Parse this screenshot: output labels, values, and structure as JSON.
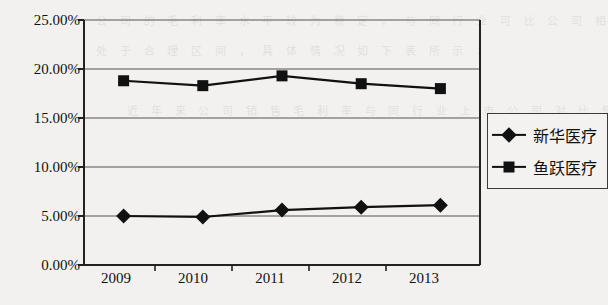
{
  "chart_data": {
    "type": "line",
    "title": "",
    "xlabel": "",
    "ylabel": "",
    "categories": [
      "2009",
      "2010",
      "2011",
      "2012",
      "2013"
    ],
    "ylim": [
      0,
      25
    ],
    "ytick_labels": [
      "0.00%",
      "5.00%",
      "10.00%",
      "15.00%",
      "20.00%",
      "25.00%"
    ],
    "ytick_values": [
      0,
      5,
      10,
      15,
      20,
      25
    ],
    "grid": true,
    "grid_axis": "y",
    "legend_position": "right",
    "series": [
      {
        "name": "新华医疗",
        "marker": "diamond",
        "values": [
          5.0,
          4.9,
          5.6,
          5.9,
          6.1
        ]
      },
      {
        "name": "鱼跃医疗",
        "marker": "square",
        "values": [
          18.8,
          18.3,
          19.3,
          18.5,
          18.0
        ]
      }
    ]
  },
  "legend": {
    "items": [
      {
        "label": "新华医疗",
        "marker": "diamond"
      },
      {
        "label": "鱼跃医疗",
        "marker": "square"
      }
    ]
  },
  "colors": {
    "series_line": "#111111",
    "axis": "#333333",
    "grid": "#555555",
    "background": "#f2f1ef"
  },
  "scan_artifacts": {
    "bleed_text": "公 司 的 毛 利 率 水 平 较 为 稳 定 ， 与 同 行 业 可 比 公 司 相 比\n处 于 合 理 区 间 ， 具 体 情 况 如 下 表 所 示 ：\n\n    近 年 来 公 司 销 售 毛 利 率 与 同 行 业 上 市 公 司 对 比 情 况"
  }
}
